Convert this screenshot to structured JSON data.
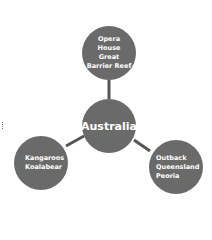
{
  "diagram": {
    "type": "mind-map",
    "center": {
      "label": "Australia"
    },
    "branches": [
      {
        "position": "top",
        "items": [
          "Opera",
          "House",
          "Great",
          "Barrier Reef"
        ]
      },
      {
        "position": "bottom-left",
        "items": [
          "Kangaroos",
          "Koalabear"
        ]
      },
      {
        "position": "bottom-right",
        "items": [
          "Outback",
          "Queensland",
          "Peoria"
        ]
      }
    ],
    "colors": {
      "node_fill": "#6a6a6a",
      "connector": "#555555",
      "text": "#ffffff"
    }
  }
}
